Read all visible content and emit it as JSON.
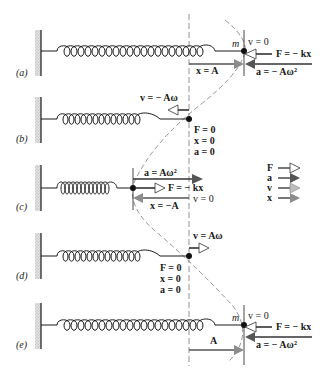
{
  "diagram": {
    "colors": {
      "ink": "#1a1a1a",
      "wall": "#b8b8b8",
      "guide": "#777777",
      "force_arrow_fill": "#ffffff",
      "accel_arrow_fill": "#555555",
      "vel_arrow_fill": "#bdbdbd",
      "disp_arrow_fill": "#8c8c8c"
    },
    "legend": [
      {
        "symbol": "F",
        "style": "open"
      },
      {
        "symbol": "a",
        "style": "dark"
      },
      {
        "symbol": "v",
        "style": "light"
      },
      {
        "symbol": "x",
        "style": "medium"
      }
    ],
    "panels": [
      {
        "label": "(a)",
        "mass": "m",
        "labels": [
          "v = 0",
          "F = − kx",
          "x = A",
          "a = − Aω²"
        ]
      },
      {
        "label": "(b)",
        "labels": [
          "v = − Aω",
          "F = 0",
          "x = 0",
          "a = 0"
        ]
      },
      {
        "label": "(c)",
        "labels": [
          "a = Aω²",
          "F = − kx",
          "x = −A",
          "v = 0"
        ]
      },
      {
        "label": "(d)",
        "labels": [
          "v = Aω",
          "F = 0",
          "x = 0",
          "a = 0"
        ]
      },
      {
        "label": "(e)",
        "mass": "m",
        "labels": [
          "v = 0",
          "F = − kx",
          "A",
          "a = − Aω²"
        ]
      }
    ]
  }
}
